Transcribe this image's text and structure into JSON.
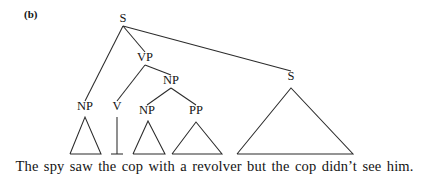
{
  "figure": {
    "panel_label": "(b)",
    "sentence": "The spy saw the cop with a revolver but the cop didn’t see him.",
    "ink_color": "#2b2b2b",
    "text_color": "#141414",
    "background_color": "#ffffff"
  },
  "tree": {
    "nodes": [
      {
        "id": "root-s",
        "label": "S",
        "x": 123,
        "y": 22
      },
      {
        "id": "vp",
        "label": "VP",
        "x": 145,
        "y": 61
      },
      {
        "id": "obj-np",
        "label": "NP",
        "x": 171,
        "y": 84
      },
      {
        "id": "subj-np",
        "label": "NP",
        "x": 85,
        "y": 110
      },
      {
        "id": "verb-v",
        "label": "V",
        "x": 117,
        "y": 110
      },
      {
        "id": "inner-np",
        "label": "NP",
        "x": 147,
        "y": 114
      },
      {
        "id": "pp",
        "label": "PP",
        "x": 196,
        "y": 114
      },
      {
        "id": "right-s",
        "label": "S",
        "x": 291,
        "y": 80
      }
    ],
    "branches": [
      {
        "id": "s-to-np",
        "from": "root-s",
        "to": "subj-np"
      },
      {
        "id": "s-to-vp",
        "from": "root-s",
        "to": "vp"
      },
      {
        "id": "s-to-s",
        "from": "root-s",
        "to": "right-s"
      },
      {
        "id": "vp-to-v",
        "from": "vp",
        "to": "verb-v"
      },
      {
        "id": "vp-to-np",
        "from": "vp",
        "to": "obj-np"
      },
      {
        "id": "np-to-np",
        "from": "obj-np",
        "to": "inner-np"
      },
      {
        "id": "np-to-pp",
        "from": "obj-np",
        "to": "pp"
      }
    ],
    "triangles": [
      {
        "id": "triangle-subject-np",
        "covers": "The spy",
        "apex_x": 85,
        "apex_y": 117,
        "left_x": 70,
        "right_x": 101,
        "base_y": 154
      },
      {
        "id": "triangle-object-np",
        "covers": "the cop",
        "apex_x": 148,
        "apex_y": 121,
        "left_x": 133,
        "right_x": 165,
        "base_y": 154
      },
      {
        "id": "triangle-pp",
        "covers": "with a revolver",
        "apex_x": 196,
        "apex_y": 122,
        "left_x": 172,
        "right_x": 222,
        "base_y": 154
      },
      {
        "id": "triangle-right-s",
        "covers": "but the cop didn’t see him.",
        "apex_x": 291,
        "apex_y": 88,
        "left_x": 237,
        "right_x": 353,
        "base_y": 154
      }
    ],
    "stems": [
      {
        "id": "stem-verb",
        "label": "saw",
        "x": 117,
        "top_y": 117,
        "base_y": 154,
        "tick_half_width": 6
      }
    ]
  }
}
